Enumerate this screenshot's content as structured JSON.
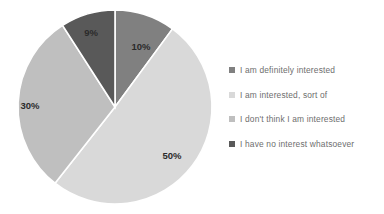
{
  "chart_data": {
    "type": "pie",
    "title": "",
    "categories": [
      "I am definitely interested",
      "I am interested, sort of",
      "I don't think I am interested",
      "I have no interest whatsoever"
    ],
    "values": [
      10,
      50,
      30,
      9
    ],
    "data_labels": [
      "10%",
      "50%",
      "30%",
      "9%"
    ],
    "colors": [
      "#808080",
      "#d9d9d9",
      "#bfbfbf",
      "#595959"
    ],
    "legend_position": "right",
    "grid": false,
    "start_angle_deg": 0,
    "direction": "clockwise",
    "slice_border_color": "#ffffff",
    "background_color": "#ffffff",
    "label_color": "#2b2b2b",
    "legend_text_color": "#6e6e6e"
  },
  "legend": {
    "items": [
      {
        "label": "I am definitely interested",
        "color": "#808080"
      },
      {
        "label": "I am interested, sort of",
        "color": "#d9d9d9"
      },
      {
        "label": "I don't think I am interested",
        "color": "#bfbfbf"
      },
      {
        "label": "I have no interest whatsoever",
        "color": "#595959"
      }
    ]
  },
  "slices": [
    {
      "label": "10%",
      "cx": 141,
      "cy": 47
    },
    {
      "label": "50%",
      "cx": 172,
      "cy": 156
    },
    {
      "label": "30%",
      "cx": 30,
      "cy": 106
    },
    {
      "label": "9%",
      "cx": 91,
      "cy": 33
    }
  ]
}
